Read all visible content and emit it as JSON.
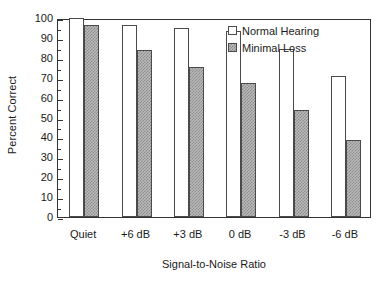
{
  "chart_data": {
    "type": "bar",
    "title": "",
    "xlabel": "Signal-to-Noise Ratio",
    "ylabel": "Percent Correct",
    "categories": [
      "Quiet",
      "+6 dB",
      "+3 dB",
      "0 dB",
      "-3 dB",
      "-6 dB"
    ],
    "series": [
      {
        "name": "Normal Hearing",
        "values": [
          100,
          96.5,
          95,
          93.5,
          84.5,
          71
        ],
        "fill": "#ffffff",
        "pattern": "solid-open"
      },
      {
        "name": "Minimal Loss",
        "values": [
          96.5,
          84,
          75.5,
          67.5,
          54,
          38.5
        ],
        "fill": "#b9b9b9",
        "pattern": "checker-hatch"
      }
    ],
    "ylim": [
      0,
      100
    ],
    "yticks": [
      0,
      10,
      20,
      30,
      40,
      50,
      60,
      70,
      80,
      90,
      100
    ],
    "ytick_labels": [
      "0",
      "10",
      "20",
      "30",
      "40",
      "50",
      "60",
      "70",
      "80",
      "90",
      "100"
    ],
    "grid": false,
    "legend_position": "top-right",
    "axis_color": "#333333"
  },
  "legend": {
    "entries": [
      {
        "label": "Normal Hearing"
      },
      {
        "label": "Minimal Loss"
      }
    ]
  }
}
